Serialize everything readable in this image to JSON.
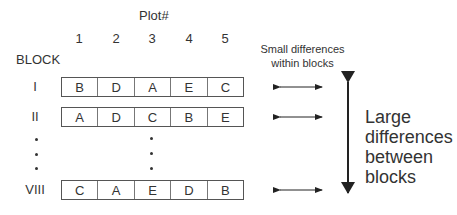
{
  "diagram": {
    "title": "Plot#",
    "block_label": "BLOCK",
    "plot_numbers": [
      "1",
      "2",
      "3",
      "4",
      "5"
    ],
    "blocks": [
      {
        "label": "I",
        "plots": [
          "B",
          "D",
          "A",
          "E",
          "C"
        ]
      },
      {
        "label": "II",
        "plots": [
          "A",
          "D",
          "C",
          "B",
          "E"
        ]
      },
      {
        "label": "VIII",
        "plots": [
          "C",
          "A",
          "E",
          "D",
          "B"
        ]
      }
    ],
    "ellipsis": "• • •",
    "small_diff_label_line1": "Small differences",
    "small_diff_label_line2": "within blocks",
    "large_diff_label": [
      "Large",
      "differences",
      "between",
      "blocks"
    ]
  }
}
